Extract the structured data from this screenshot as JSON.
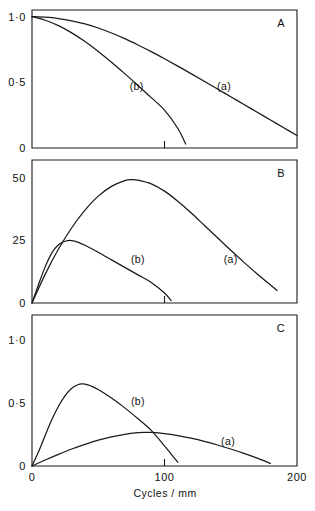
{
  "figure": {
    "xlabel": "Cycles / mm",
    "panels": [
      {
        "id": "A",
        "label": "A",
        "ylabel": "",
        "ytick_labels": [
          "1·0",
          "0·5",
          "0"
        ],
        "ytick_values": [
          1.0,
          0.5,
          0
        ],
        "ylim": [
          0,
          1.05
        ],
        "curve_labels": [
          {
            "text": "(a)",
            "x": 145,
            "y": 0.47
          },
          {
            "text": "(b)",
            "x": 79,
            "y": 0.47
          }
        ]
      },
      {
        "id": "B",
        "label": "B",
        "ylabel": "",
        "ytick_labels": [
          "50",
          "25",
          "0"
        ],
        "ytick_values": [
          50,
          25,
          0
        ],
        "ylim": [
          0,
          57
        ],
        "curve_labels": [
          {
            "text": "(a)",
            "x": 150,
            "y": 17.5
          },
          {
            "text": "(b)",
            "x": 80,
            "y": 17.5
          }
        ]
      },
      {
        "id": "C",
        "label": "C",
        "ylabel": "",
        "ytick_labels": [
          "1·0",
          "0·5",
          "0"
        ],
        "ytick_values": [
          1.0,
          0.5,
          0
        ],
        "ylim": [
          0,
          1.2
        ],
        "curve_labels": [
          {
            "text": "(a)",
            "x": 148,
            "y": 0.2
          },
          {
            "text": "(b)",
            "x": 80,
            "y": 0.52
          }
        ]
      }
    ]
  },
  "chart_data": [
    {
      "type": "line",
      "panel": "A",
      "title": "A",
      "xlabel": "Cycles / mm",
      "ylabel": "",
      "xlim": [
        0,
        200
      ],
      "ylim": [
        0,
        1.05
      ],
      "xticks": [
        0,
        100,
        200
      ],
      "yticks": [
        0,
        0.5,
        1.0
      ],
      "ytick_labels": [
        "0",
        "0·5",
        "1·0"
      ],
      "grid": false,
      "series": [
        {
          "name": "(a)",
          "x": [
            0,
            10,
            20,
            30,
            40,
            50,
            60,
            70,
            80,
            90,
            100,
            110,
            120,
            130,
            140,
            150,
            160,
            170,
            180,
            190,
            200
          ],
          "y": [
            1.0,
            0.995,
            0.985,
            0.968,
            0.944,
            0.913,
            0.875,
            0.832,
            0.784,
            0.733,
            0.679,
            0.623,
            0.566,
            0.508,
            0.449,
            0.39,
            0.331,
            0.272,
            0.213,
            0.154,
            0.095
          ]
        },
        {
          "name": "(b)",
          "x": [
            0,
            10,
            20,
            30,
            40,
            50,
            60,
            70,
            80,
            90,
            100,
            110,
            116
          ],
          "y": [
            1.0,
            0.972,
            0.931,
            0.876,
            0.81,
            0.735,
            0.653,
            0.566,
            0.476,
            0.383,
            0.288,
            0.15,
            0.03
          ]
        }
      ]
    },
    {
      "type": "line",
      "panel": "B",
      "title": "B",
      "xlabel": "Cycles / mm",
      "ylabel": "",
      "xlim": [
        0,
        200
      ],
      "ylim": [
        0,
        57
      ],
      "xticks": [
        0,
        100,
        200
      ],
      "yticks": [
        0,
        25,
        50
      ],
      "ytick_labels": [
        "0",
        "25",
        "50"
      ],
      "grid": false,
      "series": [
        {
          "name": "(a)",
          "x": [
            0,
            10,
            20,
            30,
            40,
            50,
            60,
            70,
            75,
            80,
            90,
            100,
            110,
            120,
            130,
            140,
            150,
            160,
            170,
            180,
            185
          ],
          "y": [
            0,
            11.5,
            21.5,
            30.0,
            37.0,
            42.6,
            46.5,
            48.8,
            49.2,
            49.0,
            47.5,
            44.6,
            40.6,
            36.0,
            31.0,
            26.0,
            21.0,
            16.2,
            11.6,
            7.2,
            5.0
          ]
        },
        {
          "name": "(b)",
          "x": [
            0,
            5,
            10,
            15,
            20,
            25,
            30,
            35,
            40,
            50,
            60,
            70,
            80,
            90,
            100,
            105
          ],
          "y": [
            0,
            7.5,
            14.5,
            20.0,
            23.2,
            24.6,
            24.9,
            24.2,
            23.0,
            20.2,
            17.2,
            14.2,
            11.2,
            8.2,
            4.0,
            1.0
          ]
        }
      ]
    },
    {
      "type": "line",
      "panel": "C",
      "title": "C",
      "xlabel": "Cycles / mm",
      "ylabel": "",
      "xlim": [
        0,
        200
      ],
      "ylim": [
        0,
        1.2
      ],
      "xticks": [
        0,
        100,
        200
      ],
      "yticks": [
        0,
        0.5,
        1.0
      ],
      "ytick_labels": [
        "0",
        "0·5",
        "1·0"
      ],
      "grid": false,
      "series": [
        {
          "name": "(a)",
          "x": [
            0,
            10,
            20,
            30,
            40,
            50,
            60,
            70,
            80,
            85,
            90,
            100,
            110,
            120,
            130,
            140,
            150,
            160,
            170,
            180
          ],
          "y": [
            0,
            0.048,
            0.093,
            0.135,
            0.172,
            0.205,
            0.232,
            0.252,
            0.265,
            0.268,
            0.267,
            0.258,
            0.242,
            0.221,
            0.196,
            0.167,
            0.135,
            0.1,
            0.062,
            0.02
          ]
        },
        {
          "name": "(b)",
          "x": [
            0,
            5,
            10,
            15,
            20,
            25,
            30,
            35,
            38,
            40,
            45,
            50,
            60,
            70,
            80,
            90,
            100,
            105,
            110
          ],
          "y": [
            0,
            0.115,
            0.245,
            0.37,
            0.475,
            0.56,
            0.618,
            0.648,
            0.652,
            0.65,
            0.634,
            0.608,
            0.54,
            0.462,
            0.375,
            0.283,
            0.16,
            0.095,
            0.03
          ]
        }
      ]
    }
  ]
}
